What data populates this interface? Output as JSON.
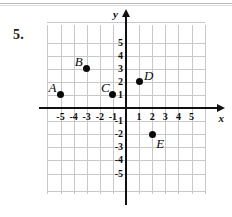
{
  "problem": {
    "number": "5."
  },
  "chart_data": {
    "type": "scatter",
    "title": "",
    "xlabel": "x",
    "ylabel": "y",
    "xlim": [
      -6,
      6
    ],
    "ylim": [
      -6,
      6
    ],
    "grid": true,
    "legend": "none",
    "xticks": [
      -5,
      -4,
      -3,
      -2,
      -1,
      1,
      2,
      3,
      4,
      5
    ],
    "yticks": [
      5,
      4,
      3,
      2,
      1,
      -1,
      -2,
      -3,
      -4,
      -5
    ],
    "xtick_labels": [
      "-5",
      "-4",
      "-3",
      "-2",
      "-1",
      "1",
      "2",
      "3",
      "4",
      "5"
    ],
    "ytick_labels": [
      "5",
      "4",
      "3",
      "2",
      "1",
      "-1",
      "-2",
      "-3",
      "-4",
      "-5"
    ],
    "points": [
      {
        "label": "A",
        "x": -5,
        "y": 1,
        "label_pos": "upper-left"
      },
      {
        "label": "B",
        "x": -3,
        "y": 3,
        "label_pos": "upper-left"
      },
      {
        "label": "C",
        "x": -1,
        "y": 1,
        "label_pos": "upper-left"
      },
      {
        "label": "D",
        "x": 1,
        "y": 2,
        "label_pos": "upper-right"
      },
      {
        "label": "E",
        "x": 2,
        "y": -2,
        "label_pos": "lower-right"
      }
    ]
  },
  "colors": {
    "grid": "#c8c8cc",
    "axis": "#111111",
    "point": "#0a0a0a",
    "text": "#0d0d0d",
    "background": "#ffffff"
  }
}
